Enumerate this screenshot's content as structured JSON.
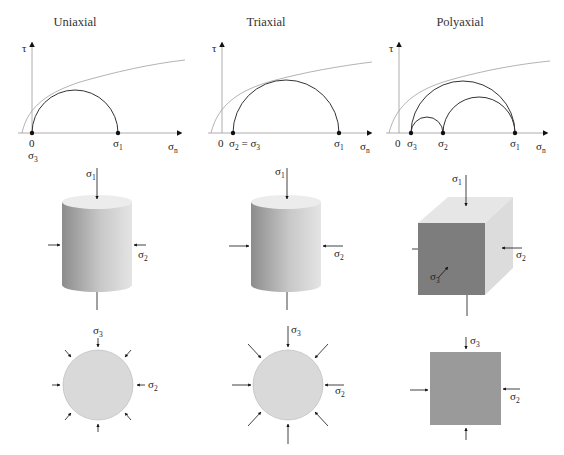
{
  "figure": {
    "columns": [
      {
        "title": "Uniaxial",
        "mohr": {
          "tau_label": "τ",
          "sigma_n_label": "σ",
          "sigma_n_sub": "n",
          "origin_label": "0",
          "points": [
            {
              "label": "σ",
              "sub": "3",
              "position": "origin"
            },
            {
              "label": "σ",
              "sub": "1",
              "position": "right"
            }
          ],
          "circles": 1
        },
        "specimen": {
          "shape": "cylinder",
          "labels": [
            {
              "label": "σ",
              "sub": "1"
            },
            {
              "label": "σ",
              "sub": "2"
            }
          ]
        },
        "cross_section": {
          "shape": "circle",
          "labels": [
            {
              "label": "σ",
              "sub": "3"
            },
            {
              "label": "σ",
              "sub": "2"
            }
          ]
        }
      },
      {
        "title": "Triaxial",
        "mohr": {
          "tau_label": "τ",
          "sigma_n_label": "σ",
          "sigma_n_sub": "n",
          "origin_label": "0",
          "points": [
            {
              "label": "σ",
              "sub": "2",
              "extra": " = σ",
              "extra_sub": "3"
            },
            {
              "label": "σ",
              "sub": "1"
            }
          ],
          "circles": 1
        },
        "specimen": {
          "shape": "cylinder",
          "labels": [
            {
              "label": "σ",
              "sub": "1"
            },
            {
              "label": "σ",
              "sub": "2"
            }
          ]
        },
        "cross_section": {
          "shape": "circle",
          "labels": [
            {
              "label": "σ",
              "sub": "3"
            },
            {
              "label": "σ",
              "sub": "2"
            }
          ]
        }
      },
      {
        "title": "Polyaxial",
        "mohr": {
          "tau_label": "τ",
          "sigma_n_label": "σ",
          "sigma_n_sub": "n",
          "origin_label": "0",
          "points": [
            {
              "label": "σ",
              "sub": "3"
            },
            {
              "label": "σ",
              "sub": "2"
            },
            {
              "label": "σ",
              "sub": "1"
            }
          ],
          "circles": 3
        },
        "specimen": {
          "shape": "cube",
          "labels": [
            {
              "label": "σ",
              "sub": "1"
            },
            {
              "label": "σ",
              "sub": "2"
            },
            {
              "label": "σ",
              "sub": "3"
            }
          ]
        },
        "cross_section": {
          "shape": "square",
          "labels": [
            {
              "label": "σ",
              "sub": "3"
            },
            {
              "label": "σ",
              "sub": "2"
            }
          ]
        }
      }
    ],
    "colors": {
      "axis": "#9a9a9a",
      "envelope": "#a0a0a0",
      "circle": "#333333",
      "point": "#111111",
      "cylinder_dark": "#8e8e8e",
      "cylinder_light": "#e2e2e2",
      "cylinder_top": "#ececec",
      "cube_front": "#7d7d7d",
      "cube_side": "#dcdcdc",
      "cube_top": "#e6e6e6",
      "disc_fill": "#d9d9d9",
      "square_fill": "#9a9a9a"
    }
  }
}
